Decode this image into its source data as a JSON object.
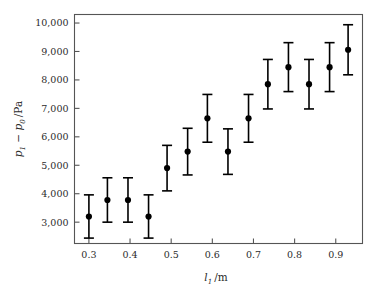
{
  "chart_data": {
    "type": "scatter",
    "title": "",
    "subtitle": "",
    "xlabel": "l₁ /m",
    "ylabel": "p₁ − p₀ /Pa",
    "xlabel_parts": {
      "symbol": "l",
      "subscript": "1",
      "unit": "/m"
    },
    "ylabel_parts": {
      "symbol1": "p",
      "subscript1": "1",
      "operator": "−",
      "symbol2": "p",
      "subscript2": "0",
      "unit": "/Pa"
    },
    "xlim": [
      0.265,
      0.965
    ],
    "ylim": [
      2250,
      10300
    ],
    "xticks": [
      0.3,
      0.4,
      0.5,
      0.6,
      0.7,
      0.8,
      0.9
    ],
    "xticklabels": [
      "0.3",
      "0.4",
      "0.5",
      "0.6",
      "0.7",
      "0.8",
      "0.9"
    ],
    "yticks": [
      3000,
      4000,
      5000,
      6000,
      7000,
      8000,
      9000,
      10000
    ],
    "yticklabels": [
      "3,000",
      "4,000",
      "5,000",
      "6,000",
      "7,000",
      "8,000",
      "9,000",
      "10,000"
    ],
    "grid": false,
    "legend": null,
    "error_bars": "symmetric vertical",
    "marker": "filled circle",
    "marker_color": "#000000",
    "errorbar_color": "#000000",
    "frame_color": "#555555",
    "background_color": "#ffffff",
    "x": [
      0.3,
      0.345,
      0.395,
      0.445,
      0.49,
      0.54,
      0.588,
      0.638,
      0.688,
      0.735,
      0.785,
      0.835,
      0.885,
      0.93
    ],
    "y": [
      3200,
      3780,
      3780,
      3200,
      4900,
      5480,
      6650,
      5480,
      6650,
      7850,
      8450,
      7850,
      8450,
      9060
    ],
    "yerr": [
      760,
      780,
      780,
      760,
      800,
      820,
      840,
      800,
      840,
      870,
      860,
      870,
      860,
      880
    ],
    "series": [
      {
        "name": "measurements",
        "points": [
          {
            "x": 0.3,
            "y": 3200,
            "yerr": 760
          },
          {
            "x": 0.345,
            "y": 3780,
            "yerr": 780
          },
          {
            "x": 0.395,
            "y": 3780,
            "yerr": 780
          },
          {
            "x": 0.445,
            "y": 3200,
            "yerr": 760
          },
          {
            "x": 0.49,
            "y": 4900,
            "yerr": 800
          },
          {
            "x": 0.54,
            "y": 5480,
            "yerr": 820
          },
          {
            "x": 0.588,
            "y": 6650,
            "yerr": 840
          },
          {
            "x": 0.638,
            "y": 5480,
            "yerr": 800
          },
          {
            "x": 0.688,
            "y": 6650,
            "yerr": 840
          },
          {
            "x": 0.735,
            "y": 7850,
            "yerr": 870
          },
          {
            "x": 0.785,
            "y": 8450,
            "yerr": 860
          },
          {
            "x": 0.835,
            "y": 7850,
            "yerr": 870
          },
          {
            "x": 0.885,
            "y": 8450,
            "yerr": 860
          },
          {
            "x": 0.93,
            "y": 9060,
            "yerr": 880
          }
        ]
      }
    ]
  }
}
